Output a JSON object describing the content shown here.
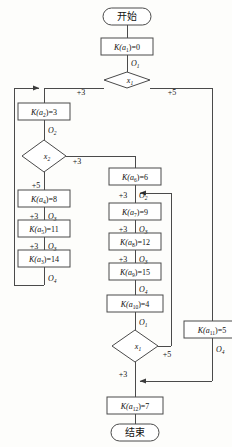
{
  "diagram": {
    "language": "zh-CN",
    "colors": {
      "stroke": "#4a4a4a",
      "text": "#111111",
      "fill": "#ffffff",
      "bg": "#fdfdfb"
    },
    "terminals": {
      "start": "开始",
      "end": "结束"
    },
    "decisions": [
      {
        "id": "d1",
        "label": "x",
        "sub": "1",
        "out_left": "+3",
        "out_right": "+5"
      },
      {
        "id": "d2",
        "label": "x",
        "sub": "2",
        "out_right": "+3",
        "out_down": "+5"
      },
      {
        "id": "d3",
        "label": "x",
        "sub": "1",
        "out_left": "+3",
        "out_right": "+5"
      }
    ],
    "process_boxes": [
      {
        "id": "p1",
        "fn": "K(a",
        "idx": "1",
        "eq": ")=0"
      },
      {
        "id": "p2",
        "fn": "K(a",
        "idx": "2",
        "eq": ")=3"
      },
      {
        "id": "p4",
        "fn": "K(a",
        "idx": "4",
        "eq": ")=8"
      },
      {
        "id": "p5",
        "fn": "K(a",
        "idx": "5",
        "eq": ")=11"
      },
      {
        "id": "p3",
        "fn": "K(a",
        "idx": "3",
        "eq": ")=14"
      },
      {
        "id": "p6",
        "fn": "K(a",
        "idx": "6",
        "eq": ")=6"
      },
      {
        "id": "p7",
        "fn": "K(a",
        "idx": "7",
        "eq": ")=9"
      },
      {
        "id": "p8",
        "fn": "K(a",
        "idx": "8",
        "eq": ")=12"
      },
      {
        "id": "p9",
        "fn": "K(a",
        "idx": "9",
        "eq": ")=15"
      },
      {
        "id": "p10",
        "fn": "K(a",
        "idx": "10",
        "eq": ")=4"
      },
      {
        "id": "p11",
        "fn": "K(a",
        "idx": "11",
        "eq": ")=5"
      },
      {
        "id": "p12",
        "fn": "K(a",
        "idx": "12",
        "eq": ")=7"
      }
    ],
    "operator_labels": [
      {
        "id": "o1a",
        "sym": "O",
        "sub": "1"
      },
      {
        "id": "o2a",
        "sym": "O",
        "sub": "2"
      },
      {
        "id": "o3a",
        "sym": "O",
        "sub": "3"
      },
      {
        "id": "o3b",
        "sym": "O",
        "sub": "3"
      },
      {
        "id": "o4a",
        "sym": "O",
        "sub": "4"
      },
      {
        "id": "o2b",
        "sym": "O",
        "sub": "2"
      },
      {
        "id": "o3c",
        "sym": "O",
        "sub": "3"
      },
      {
        "id": "o3d",
        "sym": "O",
        "sub": "3"
      },
      {
        "id": "o4b",
        "sym": "O",
        "sub": "4"
      },
      {
        "id": "o1b",
        "sym": "O",
        "sub": "1"
      },
      {
        "id": "o4c",
        "sym": "O",
        "sub": "4"
      }
    ],
    "edge_weights": [
      {
        "id": "w1",
        "text": "+3"
      },
      {
        "id": "w2",
        "text": "+5"
      },
      {
        "id": "w3",
        "text": "+3"
      },
      {
        "id": "w4",
        "text": "+5"
      },
      {
        "id": "w5",
        "text": "+3"
      },
      {
        "id": "w6",
        "text": "+3"
      },
      {
        "id": "w7",
        "text": "+3"
      },
      {
        "id": "w8",
        "text": "+3"
      },
      {
        "id": "w9",
        "text": "+3"
      },
      {
        "id": "w10",
        "text": "+3"
      },
      {
        "id": "w11",
        "text": "+5"
      },
      {
        "id": "w12",
        "text": "+3"
      }
    ]
  }
}
